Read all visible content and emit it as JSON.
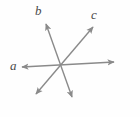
{
  "figure": {
    "background_color": "#fefefe",
    "width": 140,
    "height": 117,
    "stroke_color": "#8a8a8a",
    "label_color": "#4a4a4a",
    "stroke_width": 1.4,
    "intersection_point": {
      "x": 62,
      "y": 65
    },
    "labels": {
      "a": "a",
      "b": "b",
      "c": "c"
    },
    "lines": [
      {
        "name": "a",
        "label": "a",
        "arrowheads": "both",
        "x1": 22,
        "y1": 67,
        "x2": 114,
        "y2": 62
      },
      {
        "name": "b",
        "label": "b",
        "arrowheads": "both",
        "x1": 46,
        "y1": 24,
        "x2": 72,
        "y2": 97
      },
      {
        "name": "c",
        "label": "c",
        "arrowheads": "both",
        "x1": 93,
        "y1": 27,
        "x2": 36,
        "y2": 94
      }
    ]
  }
}
